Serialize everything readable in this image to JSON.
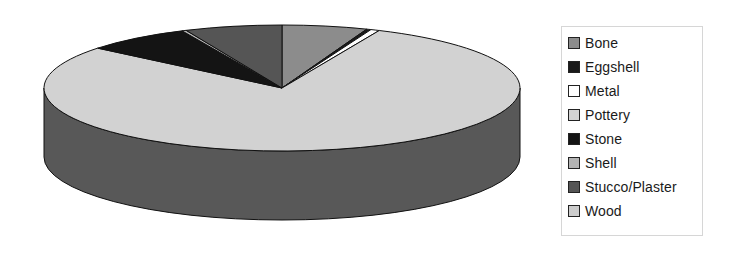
{
  "chart_data": {
    "type": "pie",
    "style": "3d",
    "title": "",
    "categories": [
      "Bone",
      "Eggshell",
      "Metal",
      "Pottery",
      "Stone",
      "Shell",
      "Stucco/Plaster",
      "Wood"
    ],
    "values": [
      5.8,
      0.3,
      0.6,
      79.2,
      7.2,
      0.3,
      6.6,
      0.0
    ],
    "unit": "percent (estimated)",
    "colors": [
      "#8c8c8c",
      "#1a1a1a",
      "#ffffff",
      "#d2d2d2",
      "#141414",
      "#b4b4b4",
      "#555555",
      "#cccccc"
    ],
    "start_angle_deg": 90,
    "direction": "clockwise",
    "legend_position": "right"
  },
  "legend": {
    "items": [
      {
        "label": "Bone",
        "color": "#8c8c8c"
      },
      {
        "label": "Eggshell",
        "color": "#1a1a1a"
      },
      {
        "label": "Metal",
        "color": "#ffffff"
      },
      {
        "label": "Pottery",
        "color": "#d2d2d2"
      },
      {
        "label": "Stone",
        "color": "#141414"
      },
      {
        "label": "Shell",
        "color": "#b4b4b4"
      },
      {
        "label": "Stucco/Plaster",
        "color": "#555555"
      },
      {
        "label": "Wood",
        "color": "#cccccc"
      }
    ]
  }
}
